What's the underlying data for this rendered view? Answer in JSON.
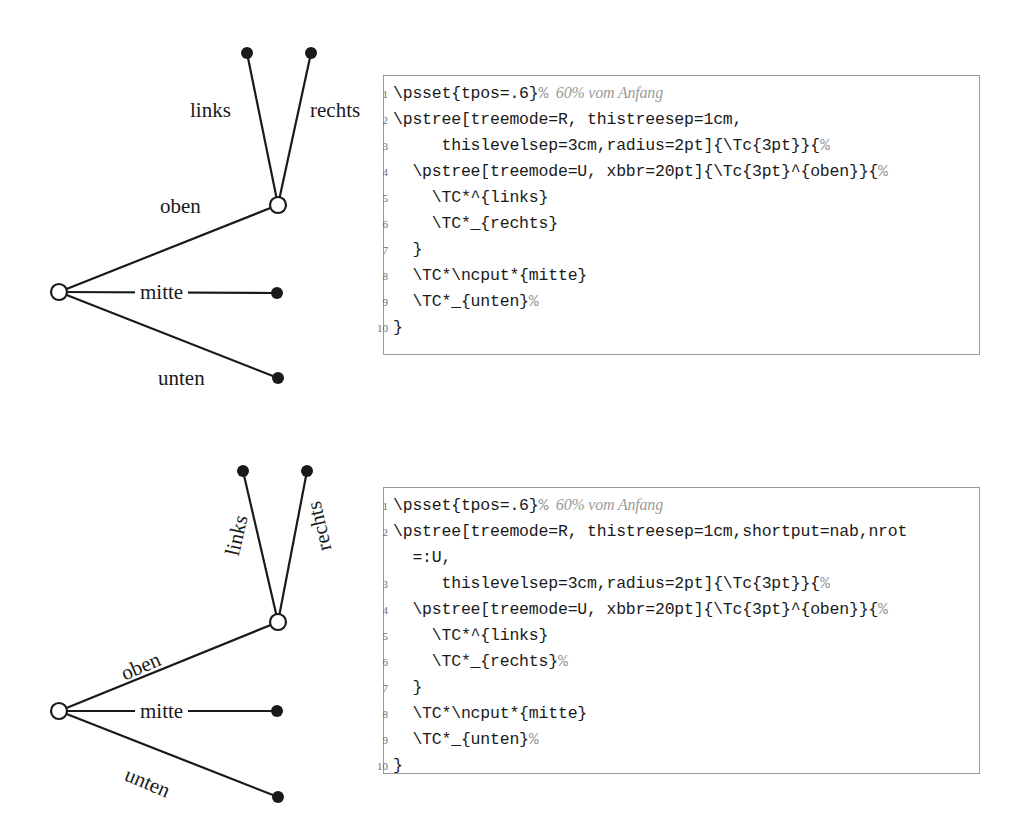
{
  "page": {
    "width": 1016,
    "height": 824,
    "background": "#ffffff",
    "ink": "#1a1a1a",
    "comment_color": "#9b9b9b",
    "rule_color": "#9a9a9a"
  },
  "figures": [
    {
      "id": "figure-top",
      "tree": {
        "name": "pstree-diagram-top",
        "rotated_labels": false,
        "nodes": [
          {
            "name": "root-node",
            "kind": "open-circle",
            "x": 59,
            "y": 292
          },
          {
            "name": "junction-node",
            "kind": "open-circle",
            "x": 278,
            "y": 205
          },
          {
            "name": "links-leaf",
            "kind": "filled-dot",
            "x": 247,
            "y": 53
          },
          {
            "name": "rechts-leaf",
            "kind": "filled-dot",
            "x": 311,
            "y": 53
          },
          {
            "name": "mitte-leaf",
            "kind": "filled-dot",
            "x": 277,
            "y": 293
          },
          {
            "name": "unten-leaf",
            "kind": "filled-dot",
            "x": 278,
            "y": 378
          }
        ],
        "edges": [
          {
            "name": "edge-oben",
            "from": "root-node",
            "to": "junction-node"
          },
          {
            "name": "edge-links",
            "from": "junction-node",
            "to": "links-leaf"
          },
          {
            "name": "edge-rechts",
            "from": "junction-node",
            "to": "rechts-leaf"
          },
          {
            "name": "edge-mitte",
            "from": "root-node",
            "to": "mitte-leaf"
          },
          {
            "name": "edge-unten",
            "from": "root-node",
            "to": "unten-leaf"
          }
        ],
        "labels": [
          {
            "name": "edge-label-links",
            "text": "links",
            "x": 190,
            "y": 100,
            "rotate": 0,
            "boxed": false
          },
          {
            "name": "edge-label-rechts",
            "text": "rechts",
            "x": 310,
            "y": 100,
            "rotate": 0,
            "boxed": false
          },
          {
            "name": "edge-label-oben",
            "text": "oben",
            "x": 160,
            "y": 196,
            "rotate": 0,
            "boxed": false
          },
          {
            "name": "edge-label-mitte",
            "text": "mitte",
            "x": 135,
            "y": 282,
            "rotate": 0,
            "boxed": true
          },
          {
            "name": "edge-label-unten",
            "text": "unten",
            "x": 158,
            "y": 368,
            "rotate": 0,
            "boxed": false
          }
        ]
      },
      "listing": {
        "name": "code-listing-top",
        "lines": [
          {
            "n": "1",
            "segments": [
              {
                "t": "\\psset{tpos=.6}",
                "s": "code"
              },
              {
                "t": "%",
                "s": "cmt"
              },
              {
                "t": "  60% vom Anfang",
                "s": "cmt-it"
              }
            ]
          },
          {
            "n": "2",
            "segments": [
              {
                "t": "\\pstree[treemode=R, thistreesep=1cm,",
                "s": "code"
              }
            ]
          },
          {
            "n": "3",
            "segments": [
              {
                "t": "     thislevelsep=3cm,radius=2pt]{\\Tc{3pt}}{",
                "s": "code"
              },
              {
                "t": "%",
                "s": "cmt"
              }
            ]
          },
          {
            "n": "4",
            "segments": [
              {
                "t": "  \\pstree[treemode=U, xbbr=20pt]{\\Tc{3pt}^{oben}}{",
                "s": "code"
              },
              {
                "t": "%",
                "s": "cmt"
              }
            ]
          },
          {
            "n": "5",
            "segments": [
              {
                "t": "    \\TC*^{links}",
                "s": "code"
              }
            ]
          },
          {
            "n": "6",
            "segments": [
              {
                "t": "    \\TC*_{rechts}",
                "s": "code"
              }
            ]
          },
          {
            "n": "7",
            "segments": [
              {
                "t": "  }",
                "s": "code"
              }
            ]
          },
          {
            "n": "8",
            "segments": [
              {
                "t": "  \\TC*\\ncput*{mitte}",
                "s": "code"
              }
            ]
          },
          {
            "n": "9",
            "segments": [
              {
                "t": "  \\TC*_{unten}",
                "s": "code"
              },
              {
                "t": "%",
                "s": "cmt"
              }
            ]
          },
          {
            "n": "10",
            "segments": [
              {
                "t": "}",
                "s": "code"
              }
            ]
          }
        ]
      }
    },
    {
      "id": "figure-bottom",
      "tree": {
        "name": "pstree-diagram-bottom",
        "rotated_labels": true,
        "nodes": [
          {
            "name": "root-node",
            "kind": "open-circle",
            "x": 59,
            "y": 711
          },
          {
            "name": "junction-node",
            "kind": "open-circle",
            "x": 278,
            "y": 622
          },
          {
            "name": "links-leaf",
            "kind": "filled-dot",
            "x": 243,
            "y": 471
          },
          {
            "name": "rechts-leaf",
            "kind": "filled-dot",
            "x": 307,
            "y": 471
          },
          {
            "name": "mitte-leaf",
            "kind": "filled-dot",
            "x": 277,
            "y": 711
          },
          {
            "name": "unten-leaf",
            "kind": "filled-dot",
            "x": 278,
            "y": 797
          }
        ],
        "edges": [
          {
            "name": "edge-oben",
            "from": "root-node",
            "to": "junction-node"
          },
          {
            "name": "edge-links",
            "from": "junction-node",
            "to": "links-leaf"
          },
          {
            "name": "edge-rechts",
            "from": "junction-node",
            "to": "rechts-leaf"
          },
          {
            "name": "edge-mitte",
            "from": "root-node",
            "to": "mitte-leaf"
          },
          {
            "name": "edge-unten",
            "from": "root-node",
            "to": "unten-leaf"
          }
        ],
        "labels": [
          {
            "name": "edge-label-links",
            "text": "links",
            "x": 222,
            "y": 553,
            "rotate": -77,
            "boxed": false
          },
          {
            "name": "edge-label-rechts",
            "text": "rechts",
            "x": 315,
            "y": 553,
            "rotate": -103,
            "boxed": false
          },
          {
            "name": "edge-label-oben",
            "text": "oben",
            "x": 118,
            "y": 665,
            "rotate": -23,
            "boxed": false
          },
          {
            "name": "edge-label-mitte",
            "text": "mitte",
            "x": 135,
            "y": 701,
            "rotate": 0,
            "boxed": true
          },
          {
            "name": "edge-label-unten",
            "text": "unten",
            "x": 130,
            "y": 764,
            "rotate": 23,
            "boxed": false
          }
        ]
      },
      "listing": {
        "name": "code-listing-bottom",
        "lines": [
          {
            "n": "1",
            "segments": [
              {
                "t": "\\psset{tpos=.6}",
                "s": "code"
              },
              {
                "t": "%",
                "s": "cmt"
              },
              {
                "t": "  60% vom Anfang",
                "s": "cmt-it"
              }
            ]
          },
          {
            "n": "2",
            "segments": [
              {
                "t": "\\pstree[treemode=R, thistreesep=1cm,shortput=nab,nrot",
                "s": "code"
              }
            ]
          },
          {
            "n": "",
            "segments": [
              {
                "t": "  =:U,",
                "s": "code"
              }
            ]
          },
          {
            "n": "3",
            "segments": [
              {
                "t": "     thislevelsep=3cm,radius=2pt]{\\Tc{3pt}}{",
                "s": "code"
              },
              {
                "t": "%",
                "s": "cmt"
              }
            ]
          },
          {
            "n": "4",
            "segments": [
              {
                "t": "  \\pstree[treemode=U, xbbr=20pt]{\\Tc{3pt}^{oben}}{",
                "s": "code"
              },
              {
                "t": "%",
                "s": "cmt"
              }
            ]
          },
          {
            "n": "5",
            "segments": [
              {
                "t": "    \\TC*^{links}",
                "s": "code"
              }
            ]
          },
          {
            "n": "6",
            "segments": [
              {
                "t": "    \\TC*_{rechts}",
                "s": "code"
              },
              {
                "t": "%",
                "s": "cmt"
              }
            ]
          },
          {
            "n": "7",
            "segments": [
              {
                "t": "  }",
                "s": "code"
              }
            ]
          },
          {
            "n": "8",
            "segments": [
              {
                "t": "  \\TC*\\ncput*{mitte}",
                "s": "code"
              }
            ]
          },
          {
            "n": "9",
            "segments": [
              {
                "t": "  \\TC*_{unten}",
                "s": "code"
              },
              {
                "t": "%",
                "s": "cmt"
              }
            ]
          },
          {
            "n": "10",
            "segments": [
              {
                "t": "}",
                "s": "code"
              }
            ]
          }
        ]
      }
    }
  ]
}
